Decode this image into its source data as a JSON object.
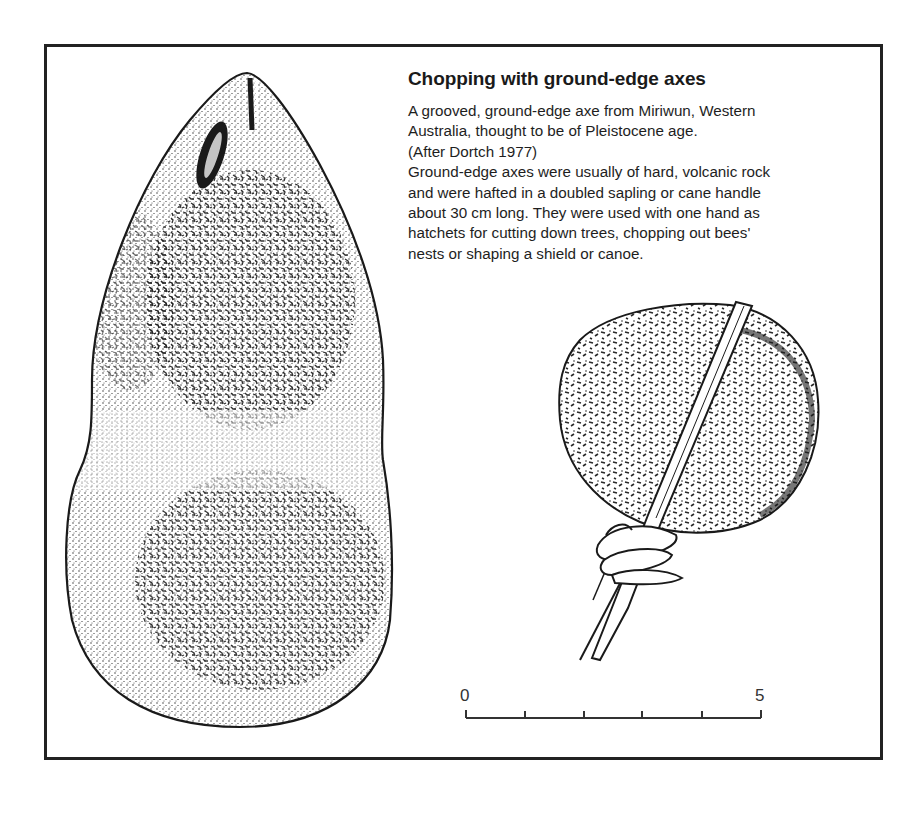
{
  "figure": {
    "title": "Chopping with ground-edge axes",
    "caption_lines": [
      "A grooved, ground-edge axe from Miriwun, Western",
      "Australia, thought to be of Pleistocene age.",
      "(After Dortch 1977)",
      "Ground-edge axes were usually of hard, volcanic rock",
      "and were hafted in a doubled sapling or cane handle",
      "about 30 cm long. They were used with one hand as",
      "hatchets for cutting down trees, chopping out bees'",
      "nests or shaping a shield or canoe."
    ],
    "illustrations": [
      {
        "name": "grooved-ground-edge-axe",
        "description": "stippled drawing of grooved ground-edge axe head"
      },
      {
        "name": "hafted-axe",
        "description": "axe head hafted in doubled cane handle, bound with lashing"
      }
    ],
    "scale_bar": {
      "start_label": "0",
      "end_label": "5",
      "divisions": 5
    },
    "colors": {
      "ink": "#1a1a1a",
      "frame": "#222222",
      "background": "#ffffff"
    }
  }
}
